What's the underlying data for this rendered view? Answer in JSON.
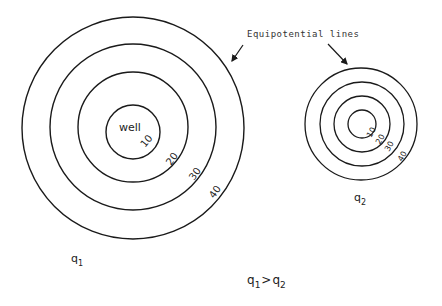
{
  "diagram": {
    "annotation": "Equipotential lines",
    "left_well": {
      "center_label": "well",
      "flow_label": "q",
      "flow_subscript": "1",
      "contours": [
        "10",
        "20",
        "30",
        "40"
      ]
    },
    "right_well": {
      "flow_label": "q",
      "flow_subscript": "2",
      "contours": [
        "10",
        "20",
        "30",
        "40"
      ]
    },
    "relation": {
      "left": "q",
      "left_sub": "1",
      "operator": ">",
      "right": "q",
      "right_sub": "2"
    },
    "colors": {
      "line": "#1a1a1a",
      "text": "#222222",
      "background": "#ffffff"
    }
  }
}
